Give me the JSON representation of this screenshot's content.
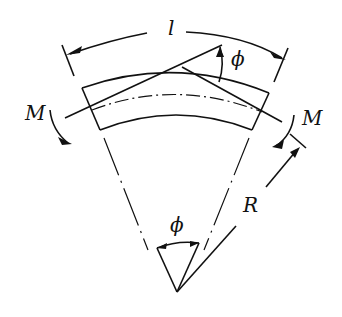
{
  "diagram": {
    "labels": {
      "arc_length": "l",
      "slope_angle": "ϕ",
      "moment_left": "M",
      "moment_right": "M",
      "radius": "R",
      "center_angle": "ϕ"
    },
    "colors": {
      "ink": "#111111",
      "background": "#ffffff"
    }
  }
}
